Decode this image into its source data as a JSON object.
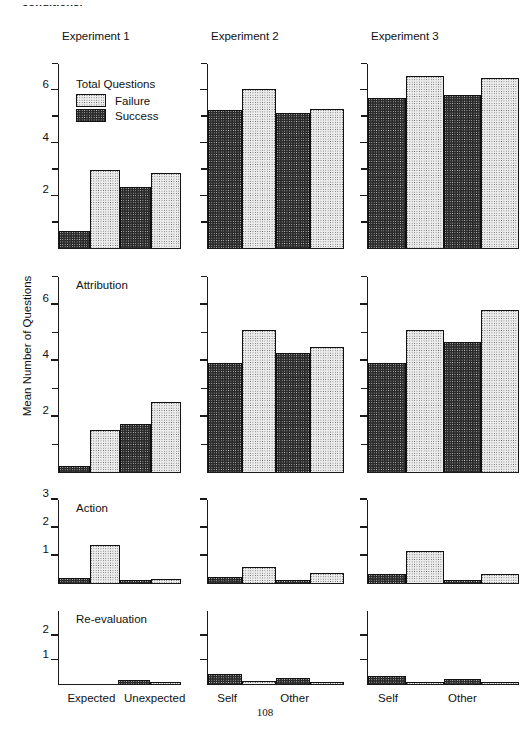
{
  "page": {
    "cutoff_header": "conditions.",
    "page_number": "108"
  },
  "chart_data": {
    "type": "bar",
    "title": "",
    "ylabel": "Mean Number of Questions",
    "xlabel": "",
    "legend": {
      "title": "Total Questions",
      "position": "inside-top-left-panel-1",
      "entries": [
        {
          "name": "Failure",
          "fill": "light-dotted",
          "color": "#ececec"
        },
        {
          "name": "Success",
          "fill": "dark-dotted",
          "color": "#2a2a2a"
        }
      ]
    },
    "column_titles": [
      "Experiment 1",
      "Experiment 2",
      "Experiment 3"
    ],
    "row_captions": [
      "Total Questions",
      "Attribution",
      "Action",
      "Re-evaluation"
    ],
    "grid": false,
    "bar_order": [
      "Success",
      "Failure",
      "Success",
      "Failure"
    ],
    "columns": [
      {
        "name": "Experiment 1",
        "x_groups": [
          "Expected",
          "Unexpected"
        ],
        "x_tick_labels": [
          "Expected",
          "Unexpected"
        ],
        "rows": [
          {
            "caption": "Total Questions",
            "ylim": [
              0,
              7
            ],
            "yticks_major": [
              2,
              4,
              6
            ],
            "yticks_minor": [
              1,
              3,
              5,
              7
            ],
            "series": [
              {
                "name": "Success",
                "values": [
                  0.65,
                  2.3
                ]
              },
              {
                "name": "Failure",
                "values": [
                  2.95,
                  2.85
                ]
              }
            ],
            "values_in_plot_order": [
              0.65,
              2.95,
              2.3,
              2.85
            ]
          },
          {
            "caption": "Attribution",
            "ylim": [
              0,
              7
            ],
            "yticks_major": [
              2,
              4,
              6
            ],
            "yticks_minor": [
              1,
              3,
              5,
              7
            ],
            "series": [
              {
                "name": "Success",
                "values": [
                  0.2,
                  1.7
                ]
              },
              {
                "name": "Failure",
                "values": [
                  1.5,
                  2.5
                ]
              }
            ],
            "values_in_plot_order": [
              0.2,
              1.5,
              1.7,
              2.5
            ]
          },
          {
            "caption": "Action",
            "ylim": [
              0,
              3
            ],
            "yticks_major": [
              1,
              2,
              3
            ],
            "yticks_minor": [],
            "series": [
              {
                "name": "Success",
                "values": [
                  0.16,
                  0.1
                ]
              },
              {
                "name": "Failure",
                "values": [
                  1.35,
                  0.14
                ]
              }
            ],
            "values_in_plot_order": [
              0.16,
              1.35,
              0.1,
              0.14
            ]
          },
          {
            "caption": "Re-evaluation",
            "ylim": [
              0,
              3
            ],
            "yticks_major": [
              1,
              2
            ],
            "yticks_minor": [],
            "series": [
              {
                "name": "Success",
                "values": [
                  0.0,
                  0.13
                ]
              },
              {
                "name": "Failure",
                "values": [
                  0.0,
                  0.07
                ]
              }
            ],
            "values_in_plot_order": [
              0.0,
              0.0,
              0.13,
              0.07
            ]
          }
        ]
      },
      {
        "name": "Experiment 2",
        "x_groups": [
          "Self",
          "Other"
        ],
        "x_tick_labels": [
          "Self",
          "Other"
        ],
        "rows": [
          {
            "caption": "",
            "ylim": [
              0,
              7
            ],
            "yticks_major": [
              2,
              4,
              6
            ],
            "yticks_minor": [
              1,
              3,
              5,
              7
            ],
            "series": [
              {
                "name": "Success",
                "values": [
                  5.25,
                  5.15
                ]
              },
              {
                "name": "Failure",
                "values": [
                  6.05,
                  5.3
                ]
              }
            ],
            "values_in_plot_order": [
              5.25,
              6.05,
              5.15,
              5.3
            ]
          },
          {
            "caption": "",
            "ylim": [
              0,
              7
            ],
            "yticks_major": [
              2,
              4,
              6
            ],
            "yticks_minor": [
              1,
              3,
              5,
              7
            ],
            "series": [
              {
                "name": "Success",
                "values": [
                  3.9,
                  4.25
                ]
              },
              {
                "name": "Failure",
                "values": [
                  5.1,
                  4.5
                ]
              }
            ],
            "values_in_plot_order": [
              3.9,
              5.1,
              4.25,
              4.5
            ]
          },
          {
            "caption": "",
            "ylim": [
              0,
              3
            ],
            "yticks_major": [
              1,
              2,
              3
            ],
            "yticks_minor": [],
            "series": [
              {
                "name": "Success",
                "values": [
                  0.2,
                  0.1
                ]
              },
              {
                "name": "Failure",
                "values": [
                  0.55,
                  0.35
                ]
              }
            ],
            "values_in_plot_order": [
              0.2,
              0.55,
              0.1,
              0.35
            ]
          },
          {
            "caption": "",
            "ylim": [
              0,
              3
            ],
            "yticks_major": [
              1,
              2
            ],
            "yticks_minor": [],
            "series": [
              {
                "name": "Success",
                "values": [
                  0.4,
                  0.22
                ]
              },
              {
                "name": "Failure",
                "values": [
                  0.1,
                  0.08
                ]
              }
            ],
            "values_in_plot_order": [
              0.4,
              0.1,
              0.22,
              0.08
            ]
          }
        ]
      },
      {
        "name": "Experiment 3",
        "x_groups": [
          "Self",
          "Other"
        ],
        "x_tick_labels": [
          "Self",
          "Other"
        ],
        "rows": [
          {
            "caption": "",
            "ylim": [
              0,
              7
            ],
            "yticks_major": [
              2,
              4,
              6
            ],
            "yticks_minor": [
              1,
              3,
              5,
              7
            ],
            "series": [
              {
                "name": "Success",
                "values": [
                  5.7,
                  5.8
                ]
              },
              {
                "name": "Failure",
                "values": [
                  6.55,
                  6.45
                ]
              }
            ],
            "values_in_plot_order": [
              5.7,
              6.55,
              5.8,
              6.45
            ]
          },
          {
            "caption": "",
            "ylim": [
              0,
              7
            ],
            "yticks_major": [
              2,
              4,
              6
            ],
            "yticks_minor": [
              1,
              3,
              5,
              7
            ],
            "series": [
              {
                "name": "Success",
                "values": [
                  3.9,
                  4.65
                ]
              },
              {
                "name": "Failure",
                "values": [
                  5.1,
                  5.8
                ]
              }
            ],
            "values_in_plot_order": [
              3.9,
              5.1,
              4.65,
              5.8
            ]
          },
          {
            "caption": "",
            "ylim": [
              0,
              3
            ],
            "yticks_major": [
              1,
              2,
              3
            ],
            "yticks_minor": [],
            "series": [
              {
                "name": "Success",
                "values": [
                  0.3,
                  0.08
                ]
              },
              {
                "name": "Failure",
                "values": [
                  1.15,
                  0.3
                ]
              }
            ],
            "values_in_plot_order": [
              0.3,
              1.15,
              0.08,
              0.3
            ]
          },
          {
            "caption": "",
            "ylim": [
              0,
              3
            ],
            "yticks_major": [
              1,
              2
            ],
            "yticks_minor": [],
            "series": [
              {
                "name": "Success",
                "values": [
                  0.32,
                  0.2
                ]
              },
              {
                "name": "Failure",
                "values": [
                  0.07,
                  0.05
                ]
              }
            ],
            "values_in_plot_order": [
              0.32,
              0.07,
              0.2,
              0.05
            ]
          }
        ]
      }
    ]
  }
}
